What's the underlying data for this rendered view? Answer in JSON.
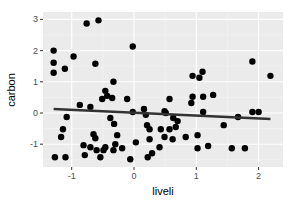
{
  "chart_data": {
    "type": "scatter",
    "title": "",
    "xlabel": "liveli",
    "ylabel": "carbon",
    "xlim": [
      -1.45,
      2.4
    ],
    "ylim": [
      -1.75,
      3.25
    ],
    "x_ticks": [
      -1,
      0,
      1,
      2
    ],
    "y_ticks": [
      -1,
      0,
      1,
      2,
      3
    ],
    "x_tick_labels": [
      "-1",
      "0",
      "1",
      "2"
    ],
    "y_tick_labels": [
      "-1",
      "0",
      "1",
      "2",
      "3"
    ],
    "grid": true,
    "legend": "none",
    "background": "#ebebeb",
    "point_color": "#000000",
    "line_color": "#333333",
    "points": [
      [
        -1.29,
        2.0
      ],
      [
        -1.29,
        1.61
      ],
      [
        -1.29,
        1.29
      ],
      [
        -1.11,
        1.42
      ],
      [
        -0.97,
        1.81
      ],
      [
        -0.62,
        1.58
      ],
      [
        -0.76,
        2.87
      ],
      [
        -0.57,
        2.97
      ],
      [
        -0.02,
        2.13
      ],
      [
        -0.33,
        1.0
      ],
      [
        -0.46,
        0.71
      ],
      [
        -0.43,
        0.55
      ],
      [
        -0.51,
        0.45
      ],
      [
        -0.35,
        0.48
      ],
      [
        -0.11,
        0.45
      ],
      [
        -0.7,
        0.19
      ],
      [
        -0.87,
        0.26
      ],
      [
        -1.08,
        -0.13
      ],
      [
        -1.14,
        -0.52
      ],
      [
        -1.17,
        -0.77
      ],
      [
        -0.65,
        -0.68
      ],
      [
        -0.62,
        -0.81
      ],
      [
        -0.38,
        -0.16
      ],
      [
        -0.32,
        -0.35
      ],
      [
        -0.27,
        -0.71
      ],
      [
        -0.3,
        -1.0
      ],
      [
        -0.81,
        -1.03
      ],
      [
        -0.7,
        -1.1
      ],
      [
        -0.79,
        -1.35
      ],
      [
        -0.6,
        -1.19
      ],
      [
        -0.49,
        -1.19
      ],
      [
        -0.46,
        -1.1
      ],
      [
        -0.54,
        -1.42
      ],
      [
        -0.33,
        -1.19
      ],
      [
        -0.19,
        -1.13
      ],
      [
        -1.27,
        -1.42
      ],
      [
        -1.1,
        -1.42
      ],
      [
        -0.06,
        -1.48
      ],
      [
        -0.02,
        0.03
      ],
      [
        0.16,
        0.13
      ],
      [
        0.51,
        0.0
      ],
      [
        0.21,
        -0.39
      ],
      [
        0.25,
        -0.52
      ],
      [
        0.43,
        -0.52
      ],
      [
        0.57,
        -0.52
      ],
      [
        0.67,
        -0.45
      ],
      [
        0.7,
        -0.26
      ],
      [
        0.63,
        -0.16
      ],
      [
        0.19,
        -0.06
      ],
      [
        0.49,
        0.06
      ],
      [
        0.57,
        0.45
      ],
      [
        0.49,
        -0.77
      ],
      [
        0.25,
        -0.84
      ],
      [
        0.62,
        -0.84
      ],
      [
        0.83,
        -0.77
      ],
      [
        0.03,
        -0.94
      ],
      [
        0.41,
        -1.1
      ],
      [
        0.22,
        -1.42
      ],
      [
        0.29,
        -1.29
      ],
      [
        0.94,
        1.19
      ],
      [
        1.1,
        1.32
      ],
      [
        1.05,
        1.13
      ],
      [
        0.94,
        0.52
      ],
      [
        0.92,
        0.32
      ],
      [
        1.11,
        0.52
      ],
      [
        1.27,
        0.58
      ],
      [
        1.11,
        0.03
      ],
      [
        1.67,
        -0.13
      ],
      [
        1.44,
        -0.39
      ],
      [
        1.02,
        -0.71
      ],
      [
        1.19,
        -1.06
      ],
      [
        1.02,
        -1.13
      ],
      [
        1.57,
        -1.13
      ],
      [
        1.78,
        -1.13
      ],
      [
        1.9,
        0.03
      ],
      [
        2.0,
        0.03
      ],
      [
        1.9,
        1.65
      ],
      [
        2.19,
        1.19
      ]
    ],
    "regression_line": {
      "x": [
        -1.29,
        2.19
      ],
      "y": [
        0.13,
        -0.19
      ]
    }
  }
}
